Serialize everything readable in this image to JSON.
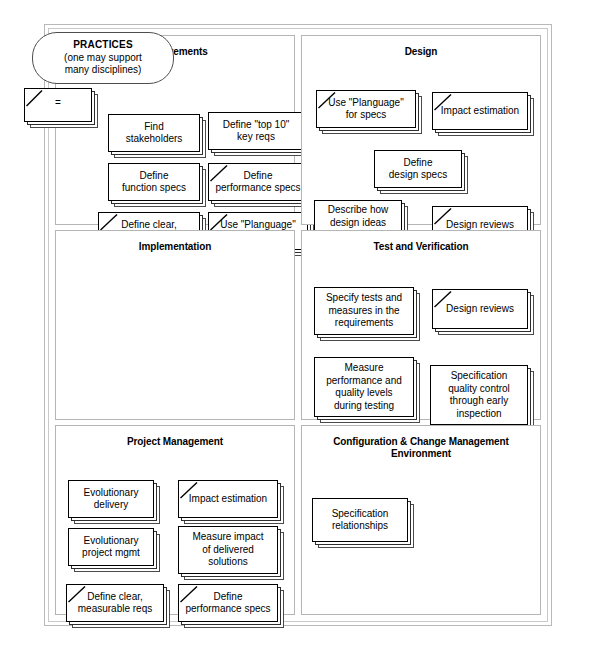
{
  "diagram": {
    "legend": {
      "bubble": {
        "line1": "PRACTICES",
        "line2": "(one may support",
        "line3": "many disciplines)"
      },
      "key_card": {
        "symbol": "=",
        "meaning": "repeated",
        "icon": "diagonal-slash-icon"
      }
    },
    "panels": [
      {
        "id": "requirements",
        "title": "Requirements",
        "cards": [
          {
            "label": "Find\nstakeholders",
            "repeated": false,
            "x": 52,
            "y": 56,
            "w": 92,
            "h": 38
          },
          {
            "label": "Define \"top 10\"\nkey reqs",
            "repeated": false,
            "x": 152,
            "y": 54,
            "w": 96,
            "h": 38
          },
          {
            "label": "Define\nfunction specs",
            "repeated": false,
            "x": 52,
            "y": 105,
            "w": 92,
            "h": 38
          },
          {
            "label": "Define\nperformance specs",
            "repeated": true,
            "x": 152,
            "y": 105,
            "w": 100,
            "h": 38
          },
          {
            "label": "Define clear,\nmeasurable reqs",
            "repeated": true,
            "x": 42,
            "y": 154,
            "w": 102,
            "h": 38
          },
          {
            "label": "Use \"Planguage\"\nfor specs",
            "repeated": true,
            "x": 152,
            "y": 154,
            "w": 100,
            "h": 38
          }
        ]
      },
      {
        "id": "design",
        "title": "Design",
        "cards": [
          {
            "label": "Use \"Planguage\"\nfor specs",
            "repeated": true,
            "x": 14,
            "y": 32,
            "w": 100,
            "h": 38
          },
          {
            "label": "Impact estimation",
            "repeated": true,
            "x": 130,
            "y": 34,
            "w": 96,
            "h": 38
          },
          {
            "label": "Define\ndesign specs",
            "repeated": false,
            "x": 72,
            "y": 92,
            "w": 88,
            "h": 38
          },
          {
            "label": "Describe how\ndesign ideas\nmeet reqs",
            "repeated": false,
            "x": 12,
            "y": 142,
            "w": 88,
            "h": 46
          },
          {
            "label": "Design reviews",
            "repeated": true,
            "x": 130,
            "y": 148,
            "w": 96,
            "h": 38
          }
        ]
      },
      {
        "id": "implementation",
        "title": "Implementation",
        "cards": []
      },
      {
        "id": "test-and-verification",
        "title": "Test and Verification",
        "cards": [
          {
            "label": "Specify tests and\nmeasures in the\nrequirements",
            "repeated": false,
            "x": 12,
            "y": 34,
            "w": 100,
            "h": 48
          },
          {
            "label": "Design reviews",
            "repeated": true,
            "x": 130,
            "y": 36,
            "w": 96,
            "h": 40
          },
          {
            "label": "Measure\nperformance and\nquality levels\nduring testing",
            "repeated": false,
            "x": 12,
            "y": 104,
            "w": 100,
            "h": 60
          },
          {
            "label": "Specification\nquality control\nthrough early\ninspection",
            "repeated": false,
            "x": 128,
            "y": 112,
            "w": 98,
            "h": 60
          }
        ]
      },
      {
        "id": "project-management",
        "title": "Project Management",
        "cards": [
          {
            "label": "Evolutionary\ndelivery",
            "repeated": false,
            "x": 12,
            "y": 32,
            "w": 86,
            "h": 38
          },
          {
            "label": "Impact estimation",
            "repeated": true,
            "x": 122,
            "y": 32,
            "w": 100,
            "h": 38
          },
          {
            "label": "Evolutionary\nproject mgmt",
            "repeated": false,
            "x": 12,
            "y": 80,
            "w": 86,
            "h": 38
          },
          {
            "label": "Measure impact\nof delivered\nsolutions",
            "repeated": false,
            "x": 122,
            "y": 78,
            "w": 100,
            "h": 48
          },
          {
            "label": "Define clear,\nmeasurable reqs",
            "repeated": true,
            "x": 10,
            "y": 136,
            "w": 98,
            "h": 38
          },
          {
            "label": "Define\nperformance specs",
            "repeated": true,
            "x": 122,
            "y": 136,
            "w": 100,
            "h": 38
          }
        ]
      },
      {
        "id": "configuration-change-management",
        "title": "Configuration & Change Management\nEnvironment",
        "cards": [
          {
            "label": "Specification\nrelationships",
            "repeated": false,
            "x": 10,
            "y": 38,
            "w": 96,
            "h": 44
          }
        ]
      }
    ]
  }
}
